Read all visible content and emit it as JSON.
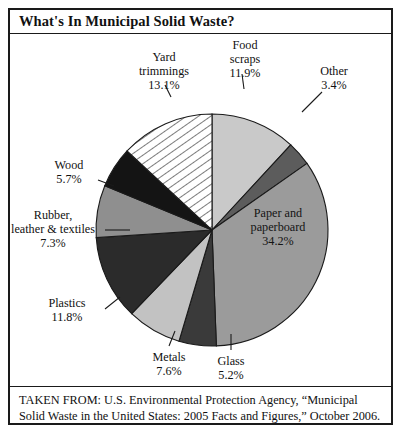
{
  "figure": {
    "title": "What's In Municipal Solid Waste?",
    "source_line1": "TAKEN FROM: U.S. Environmental Protection Agency, “Municipal",
    "source_line2": "Solid Waste in the United States: 2005 Facts and Figures,” October 2006."
  },
  "chart_data": {
    "type": "pie",
    "title": "What's In Municipal Solid Waste?",
    "unit": "percent",
    "total": 100.2,
    "legend": "none",
    "labels_placement": "callout labels around pie, largest slice labeled inside",
    "start_angle_deg": 0,
    "direction": "clockwise",
    "categories": [
      "Food scraps",
      "Other",
      "Paper and paperboard",
      "Glass",
      "Metals",
      "Plastics",
      "Rubber, leather & textiles",
      "Wood",
      "Yard trimmings"
    ],
    "values": [
      11.9,
      3.4,
      34.2,
      5.2,
      7.6,
      11.8,
      7.3,
      5.7,
      13.1
    ],
    "slices": [
      {
        "name": "Food scraps",
        "label_line1": "Food",
        "label_line2": "scraps",
        "value": 11.9,
        "value_label": "11.9%",
        "fill": "#c9c9c9",
        "pattern": "solid",
        "label_inside": false
      },
      {
        "name": "Other",
        "label_line1": "Other",
        "label_line2": "",
        "value": 3.4,
        "value_label": "3.4%",
        "fill": "#5c5c5c",
        "pattern": "solid",
        "label_inside": false
      },
      {
        "name": "Paper and paperboard",
        "label_line1": "Paper and",
        "label_line2": "paperboard",
        "value": 34.2,
        "value_label": "34.2%",
        "fill": "#9b9b9b",
        "pattern": "solid",
        "label_inside": true
      },
      {
        "name": "Glass",
        "label_line1": "Glass",
        "label_line2": "",
        "value": 5.2,
        "value_label": "5.2%",
        "fill": "#3a3a3a",
        "pattern": "solid",
        "label_inside": false
      },
      {
        "name": "Metals",
        "label_line1": "Metals",
        "label_line2": "",
        "value": 7.6,
        "value_label": "7.6%",
        "fill": "#c2c2c2",
        "pattern": "solid",
        "label_inside": false
      },
      {
        "name": "Plastics",
        "label_line1": "Plastics",
        "label_line2": "",
        "value": 11.8,
        "value_label": "11.8%",
        "fill": "#2b2b2b",
        "pattern": "solid",
        "label_inside": false
      },
      {
        "name": "Rubber, leather & textiles",
        "label_line1": "Rubber,",
        "label_line2": "leather & textiles",
        "value": 7.3,
        "value_label": "7.3%",
        "fill": "#8f8f8f",
        "pattern": "solid",
        "label_inside": false
      },
      {
        "name": "Wood",
        "label_line1": "Wood",
        "label_line2": "",
        "value": 5.7,
        "value_label": "5.7%",
        "fill": "#141414",
        "pattern": "solid",
        "label_inside": false
      },
      {
        "name": "Yard trimmings",
        "label_line1": "Yard",
        "label_line2": "trimmings",
        "value": 13.1,
        "value_label": "13.1%",
        "fill": "#ffffff",
        "pattern": "diagonal-hatch",
        "label_inside": false
      }
    ]
  }
}
